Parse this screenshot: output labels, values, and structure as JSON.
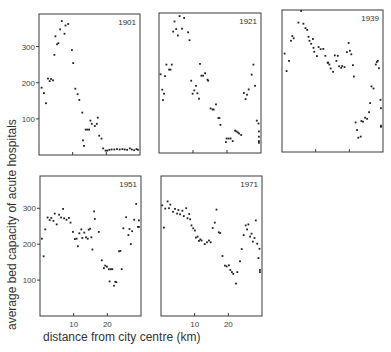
{
  "chart_data": {
    "type": "scatter",
    "title": "",
    "xlabel": "distance from city centre  (km)",
    "ylabel": "average  bed  capacity of acute hospitals",
    "xlim": [
      0,
      30
    ],
    "ylim": [
      0,
      390
    ],
    "xticks": [
      10,
      20
    ],
    "yticks": [
      100,
      200,
      300
    ],
    "grid": false,
    "legend": null,
    "panels": [
      {
        "label": "1901",
        "points": [
          [
            0.8,
            186
          ],
          [
            1.5,
            171
          ],
          [
            2.1,
            143
          ],
          [
            2.7,
            211
          ],
          [
            3.2,
            204
          ],
          [
            3.6,
            210
          ],
          [
            4.2,
            206
          ],
          [
            4.6,
            277
          ],
          [
            4.9,
            328
          ],
          [
            5.4,
            306
          ],
          [
            5.8,
            309
          ],
          [
            6.3,
            347
          ],
          [
            6.8,
            370
          ],
          [
            7.6,
            335
          ],
          [
            7.9,
            358
          ],
          [
            8.7,
            362
          ],
          [
            9.8,
            290
          ],
          [
            10.2,
            254
          ],
          [
            10.8,
            183
          ],
          [
            11.5,
            168
          ],
          [
            12.0,
            152
          ],
          [
            12.9,
            117
          ],
          [
            13.1,
            40
          ],
          [
            13.4,
            25
          ],
          [
            13.9,
            70
          ],
          [
            14.4,
            70
          ],
          [
            14.9,
            70
          ],
          [
            15.3,
            95
          ],
          [
            15.7,
            86
          ],
          [
            16.6,
            80
          ],
          [
            17.2,
            86
          ],
          [
            17.5,
            103
          ],
          [
            17.9,
            53
          ],
          [
            18.6,
            45
          ],
          [
            19.1,
            18
          ],
          [
            19.8,
            12
          ],
          [
            20.3,
            12
          ],
          [
            20.9,
            14
          ],
          [
            21.6,
            15
          ],
          [
            22.4,
            15
          ],
          [
            23.2,
            16
          ],
          [
            24.0,
            15
          ],
          [
            24.8,
            16
          ],
          [
            25.5,
            15
          ],
          [
            26.2,
            14
          ],
          [
            27.0,
            18
          ],
          [
            27.6,
            15
          ],
          [
            28.3,
            13
          ],
          [
            29.0,
            16
          ],
          [
            29.6,
            14
          ]
        ]
      },
      {
        "label": "1921",
        "points": [
          [
            0.5,
            219
          ],
          [
            1.0,
            176
          ],
          [
            1.2,
            147
          ],
          [
            1.5,
            165
          ],
          [
            1.8,
            214
          ],
          [
            2.2,
            246
          ],
          [
            3.0,
            232
          ],
          [
            3.4,
            232
          ],
          [
            3.8,
            246
          ],
          [
            4.2,
            338
          ],
          [
            4.6,
            366
          ],
          [
            5.1,
            345
          ],
          [
            5.6,
            327
          ],
          [
            6.1,
            381
          ],
          [
            6.8,
            346
          ],
          [
            7.4,
            376
          ],
          [
            8.6,
            336
          ],
          [
            9.0,
            314
          ],
          [
            9.5,
            201
          ],
          [
            9.9,
            165
          ],
          [
            10.4,
            174
          ],
          [
            10.9,
            187
          ],
          [
            11.3,
            166
          ],
          [
            11.8,
            151
          ],
          [
            12.1,
            248
          ],
          [
            12.5,
            215
          ],
          [
            13.0,
            215
          ],
          [
            13.6,
            222
          ],
          [
            14.3,
            204
          ],
          [
            14.5,
            201
          ],
          [
            15.2,
            124
          ],
          [
            15.8,
            121
          ],
          [
            16.1,
            121
          ],
          [
            16.8,
            135
          ],
          [
            17.5,
            97
          ],
          [
            17.8,
            97
          ],
          [
            18.1,
            78
          ],
          [
            19.7,
            30
          ],
          [
            19.9,
            40
          ],
          [
            20.5,
            40
          ],
          [
            21.1,
            40
          ],
          [
            21.7,
            33
          ],
          [
            22.4,
            62
          ],
          [
            22.8,
            60
          ],
          [
            23.2,
            57
          ],
          [
            23.6,
            54
          ],
          [
            24.2,
            50
          ],
          [
            25.0,
            167
          ],
          [
            25.5,
            150
          ],
          [
            25.9,
            162
          ],
          [
            26.4,
            177
          ],
          [
            27.3,
            218
          ],
          [
            27.8,
            246
          ],
          [
            28.3,
            187
          ],
          [
            28.8,
            90
          ],
          [
            29.3,
            82
          ],
          [
            29.6,
            60
          ],
          [
            29.7,
            45
          ],
          [
            29.9,
            33
          ],
          [
            30.0,
            28
          ]
        ]
      },
      {
        "label": "1939",
        "points": [
          [
            0.8,
            270
          ],
          [
            1.4,
            222
          ],
          [
            2.1,
            250
          ],
          [
            2.7,
            305
          ],
          [
            3.1,
            318
          ],
          [
            3.5,
            312
          ],
          [
            4.9,
            355
          ],
          [
            5.7,
            389
          ],
          [
            6.4,
            352
          ],
          [
            7.0,
            340
          ],
          [
            7.5,
            335
          ],
          [
            7.9,
            316
          ],
          [
            8.2,
            305
          ],
          [
            8.7,
            297
          ],
          [
            9.2,
            310
          ],
          [
            9.4,
            286
          ],
          [
            9.6,
            275
          ],
          [
            10.4,
            263
          ],
          [
            10.9,
            288
          ],
          [
            11.5,
            282
          ],
          [
            12.3,
            283
          ],
          [
            12.9,
            264
          ],
          [
            13.6,
            245
          ],
          [
            13.7,
            245
          ],
          [
            14.1,
            240
          ],
          [
            14.5,
            229
          ],
          [
            15.2,
            220
          ],
          [
            15.7,
            265
          ],
          [
            16.2,
            250
          ],
          [
            16.6,
            264
          ],
          [
            17.0,
            235
          ],
          [
            17.6,
            231
          ],
          [
            17.9,
            236
          ],
          [
            18.6,
            233
          ],
          [
            19.3,
            274
          ],
          [
            19.8,
            299
          ],
          [
            20.2,
            278
          ],
          [
            20.6,
            268
          ],
          [
            21.1,
            238
          ],
          [
            21.4,
            207
          ],
          [
            21.9,
            81
          ],
          [
            22.3,
            60
          ],
          [
            22.7,
            39
          ],
          [
            23.4,
            42
          ],
          [
            23.6,
            85
          ],
          [
            24.1,
            83
          ],
          [
            24.7,
            94
          ],
          [
            25.3,
            91
          ],
          [
            25.9,
            109
          ],
          [
            26.2,
            134
          ],
          [
            26.6,
            180
          ],
          [
            27.2,
            174
          ],
          [
            27.9,
            240
          ],
          [
            28.2,
            247
          ],
          [
            28.5,
            250
          ],
          [
            28.8,
            230
          ],
          [
            29.3,
            143
          ],
          [
            29.6,
            120
          ],
          [
            29.8,
            69
          ],
          [
            30.0,
            72
          ]
        ]
      },
      {
        "label": "1951",
        "points": [
          [
            0.6,
            215
          ],
          [
            1.1,
            166
          ],
          [
            1.6,
            241
          ],
          [
            2.3,
            274
          ],
          [
            2.9,
            267
          ],
          [
            3.4,
            273
          ],
          [
            4.0,
            265
          ],
          [
            4.4,
            285
          ],
          [
            5.0,
            255
          ],
          [
            5.7,
            282
          ],
          [
            6.3,
            274
          ],
          [
            6.9,
            298
          ],
          [
            7.2,
            272
          ],
          [
            7.9,
            268
          ],
          [
            8.6,
            273
          ],
          [
            9.1,
            260
          ],
          [
            9.8,
            234
          ],
          [
            10.4,
            214
          ],
          [
            10.9,
            215
          ],
          [
            11.3,
            194
          ],
          [
            11.7,
            230
          ],
          [
            12.3,
            241
          ],
          [
            12.6,
            217
          ],
          [
            13.2,
            232
          ],
          [
            13.7,
            219
          ],
          [
            14.2,
            215
          ],
          [
            14.5,
            240
          ],
          [
            14.9,
            243
          ],
          [
            15.3,
            219
          ],
          [
            15.6,
            185
          ],
          [
            16.1,
            291
          ],
          [
            16.3,
            270
          ],
          [
            17.5,
            234
          ],
          [
            18.4,
            155
          ],
          [
            19.0,
            133
          ],
          [
            19.4,
            140
          ],
          [
            19.9,
            137
          ],
          [
            20.5,
            130
          ],
          [
            20.7,
            96
          ],
          [
            21.1,
            130
          ],
          [
            21.5,
            130
          ],
          [
            22.0,
            84
          ],
          [
            22.4,
            95
          ],
          [
            22.7,
            94
          ],
          [
            23.5,
            180
          ],
          [
            23.9,
            181
          ],
          [
            24.3,
            130
          ],
          [
            24.8,
            244
          ],
          [
            25.6,
            275
          ],
          [
            26.3,
            225
          ],
          [
            26.6,
            242
          ],
          [
            27.0,
            200
          ],
          [
            27.4,
            236
          ],
          [
            28.0,
            268
          ],
          [
            28.6,
            312
          ],
          [
            29.1,
            248
          ],
          [
            29.5,
            248
          ],
          [
            29.9,
            266
          ]
        ]
      },
      {
        "label": "1971",
        "points": [
          [
            0.4,
            308
          ],
          [
            0.9,
            246
          ],
          [
            1.3,
            299
          ],
          [
            2.0,
            319
          ],
          [
            2.4,
            300
          ],
          [
            2.8,
            310
          ],
          [
            3.6,
            290
          ],
          [
            4.2,
            298
          ],
          [
            4.8,
            285
          ],
          [
            5.2,
            295
          ],
          [
            5.7,
            283
          ],
          [
            6.4,
            293
          ],
          [
            6.8,
            278
          ],
          [
            7.5,
            300
          ],
          [
            7.9,
            272
          ],
          [
            8.4,
            284
          ],
          [
            8.7,
            269
          ],
          [
            9.1,
            252
          ],
          [
            9.6,
            244
          ],
          [
            10.1,
            238
          ],
          [
            10.4,
            218
          ],
          [
            10.9,
            221
          ],
          [
            11.3,
            209
          ],
          [
            11.7,
            213
          ],
          [
            12.1,
            210
          ],
          [
            13.0,
            200
          ],
          [
            13.7,
            205
          ],
          [
            14.3,
            210
          ],
          [
            14.8,
            205
          ],
          [
            15.4,
            245
          ],
          [
            16.0,
            260
          ],
          [
            16.5,
            296
          ],
          [
            17.2,
            233
          ],
          [
            17.6,
            231
          ],
          [
            18.3,
            167
          ],
          [
            19.0,
            140
          ],
          [
            19.5,
            138
          ],
          [
            20.2,
            141
          ],
          [
            20.6,
            128
          ],
          [
            21.1,
            122
          ],
          [
            21.5,
            117
          ],
          [
            22.3,
            90
          ],
          [
            22.7,
            122
          ],
          [
            23.5,
            152
          ],
          [
            24.0,
            186
          ],
          [
            24.6,
            225
          ],
          [
            25.2,
            252
          ],
          [
            25.6,
            241
          ],
          [
            26.0,
            255
          ],
          [
            26.5,
            221
          ],
          [
            26.9,
            229
          ],
          [
            27.3,
            207
          ],
          [
            27.8,
            217
          ],
          [
            28.2,
            266
          ],
          [
            28.6,
            201
          ],
          [
            29.0,
            161
          ],
          [
            29.3,
            187
          ],
          [
            29.7,
            122
          ],
          [
            30.0,
            128
          ]
        ]
      }
    ]
  },
  "figure": {
    "ylabel": "average  bed  capacity of acute hospitals",
    "xlabel": "distance from city centre  (km)"
  }
}
